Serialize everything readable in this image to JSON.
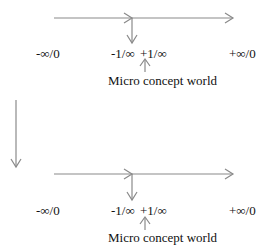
{
  "diagram": {
    "line_color": "#8a8a8a",
    "panels": [
      {
        "labels": {
          "neg_inf": "-∞/0",
          "neg_micro": "-1/∞",
          "pos_micro": "+1/∞",
          "pos_inf": "+∞/0"
        },
        "caption": "Micro concept world"
      },
      {
        "labels": {
          "neg_inf": "-∞/0",
          "neg_micro": "-1/∞",
          "pos_micro": "+1/∞",
          "pos_inf": "+∞/0"
        },
        "caption": "Micro concept world"
      }
    ],
    "connector": "down-arrow"
  }
}
